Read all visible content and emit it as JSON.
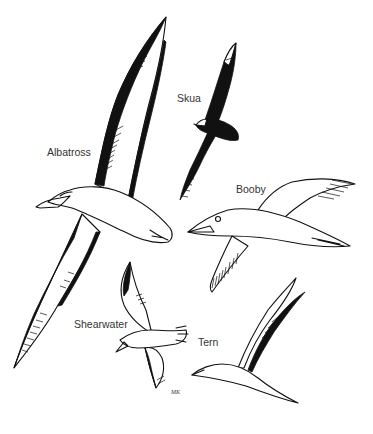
{
  "figure": {
    "ink_color": "#111111",
    "label_color": "#333333",
    "background": "#ffffff"
  },
  "labels": [
    {
      "id": "albatross",
      "text": "Albatross",
      "x": 47,
      "y": 147
    },
    {
      "id": "skua",
      "text": "Skua",
      "x": 177,
      "y": 93
    },
    {
      "id": "booby",
      "text": "Booby",
      "x": 236,
      "y": 184
    },
    {
      "id": "shearwater",
      "text": "Shearwater",
      "x": 74,
      "y": 319
    },
    {
      "id": "tern",
      "text": "Tern",
      "x": 198,
      "y": 337
    }
  ],
  "signature": {
    "text": "MK",
    "x": 171,
    "y": 389
  }
}
